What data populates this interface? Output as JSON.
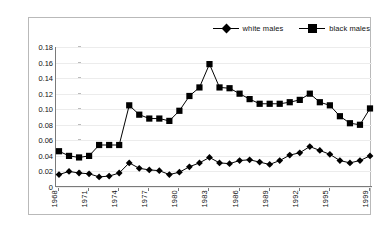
{
  "chart_data": {
    "type": "line",
    "title": "",
    "xlabel": "",
    "ylabel": "",
    "grid": true,
    "legend_position": "top-right",
    "ylim": [
      0,
      0.18
    ],
    "yticks": [
      "0",
      "0.02",
      "0.04",
      "0.06",
      "0.08",
      "0.10",
      "0.12",
      "0.14",
      "0.16",
      "0.18"
    ],
    "ytick_values": [
      0,
      0.02,
      0.04,
      0.06,
      0.08,
      0.1,
      0.12,
      0.14,
      0.16,
      0.18
    ],
    "x": [
      1968,
      1969,
      1970,
      1971,
      1972,
      1973,
      1974,
      1975,
      1976,
      1977,
      1978,
      1979,
      1980,
      1981,
      1982,
      1983,
      1984,
      1985,
      1986,
      1987,
      1988,
      1989,
      1990,
      1991,
      1992,
      1993,
      1994,
      1995,
      1996,
      1997,
      1998,
      1999
    ],
    "xtick_labels": [
      "1968",
      "1971",
      "1974",
      "1977",
      "1980",
      "1983",
      "1986",
      "1989",
      "1992",
      "1995",
      "1999"
    ],
    "xtick_years": [
      1968,
      1971,
      1974,
      1977,
      1980,
      1983,
      1986,
      1989,
      1992,
      1995,
      1999
    ],
    "series": [
      {
        "name": "white males",
        "marker": "diamond",
        "color": "#000000",
        "values": [
          0.016,
          0.02,
          0.018,
          0.017,
          0.013,
          0.014,
          0.018,
          0.031,
          0.024,
          0.022,
          0.021,
          0.016,
          0.019,
          0.026,
          0.031,
          0.038,
          0.031,
          0.03,
          0.034,
          0.035,
          0.032,
          0.029,
          0.034,
          0.041,
          0.044,
          0.052,
          0.047,
          0.042,
          0.034,
          0.031,
          0.034,
          0.04
        ]
      },
      {
        "name": "black males",
        "marker": "square",
        "color": "#000000",
        "values": [
          0.046,
          0.04,
          0.038,
          0.04,
          0.054,
          0.054,
          0.054,
          0.105,
          0.093,
          0.088,
          0.088,
          0.085,
          0.098,
          0.117,
          0.128,
          0.158,
          0.128,
          0.127,
          0.12,
          0.113,
          0.107,
          0.107,
          0.107,
          0.109,
          0.112,
          0.12,
          0.109,
          0.105,
          0.091,
          0.082,
          0.08,
          0.101
        ]
      }
    ]
  },
  "legend": {
    "items": [
      {
        "label": "white males"
      },
      {
        "label": "black males"
      }
    ]
  }
}
